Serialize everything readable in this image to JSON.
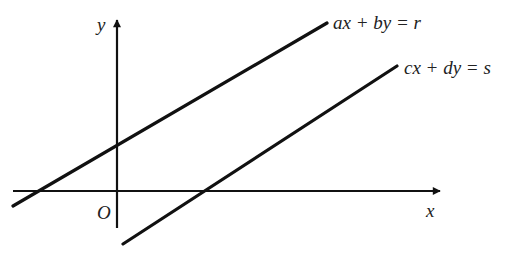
{
  "diagram": {
    "colors": {
      "stroke": "#111111",
      "text": "#222222",
      "background": "#ffffff"
    },
    "axes": {
      "x_label": "x",
      "y_label": "y",
      "origin_label": "O"
    },
    "lines": [
      {
        "id": "line-1",
        "equation": "ax + by = r"
      },
      {
        "id": "line-2",
        "equation": "cx + dy = s"
      }
    ]
  }
}
